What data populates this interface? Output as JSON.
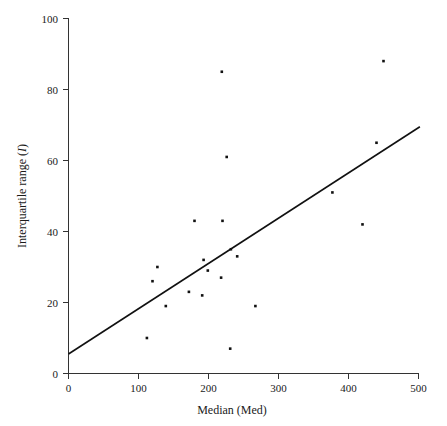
{
  "chart_data": {
    "type": "scatter",
    "title": "",
    "xlabel": "Median (Med)",
    "ylabel": "Interquartile range (I)",
    "ylabel_plain": "Interquartile range",
    "ylabel_symbol": "I",
    "xlim": [
      0,
      500
    ],
    "ylim": [
      0,
      100
    ],
    "xticks": [
      0,
      100,
      200,
      300,
      400,
      500
    ],
    "yticks": [
      0,
      20,
      40,
      60,
      80,
      100
    ],
    "xtick_labels": [
      "0",
      "100",
      "200",
      "300",
      "400",
      "500"
    ],
    "ytick_labels": [
      "0",
      "20",
      "40",
      "60",
      "80",
      "100"
    ],
    "grid": false,
    "legend": "none",
    "point_color": "#111111",
    "line_color": "#111111",
    "axis_color": "#333333",
    "background": "#ffffff",
    "marker": "square",
    "marker_size_px": 2.6,
    "series": [
      {
        "name": "observations",
        "points": [
          {
            "x": 112,
            "y": 10
          },
          {
            "x": 127,
            "y": 30
          },
          {
            "x": 120,
            "y": 26
          },
          {
            "x": 139,
            "y": 19
          },
          {
            "x": 180,
            "y": 43
          },
          {
            "x": 220,
            "y": 43
          },
          {
            "x": 172,
            "y": 23
          },
          {
            "x": 193,
            "y": 32
          },
          {
            "x": 199,
            "y": 29
          },
          {
            "x": 191,
            "y": 22
          },
          {
            "x": 218,
            "y": 27
          },
          {
            "x": 232,
            "y": 35
          },
          {
            "x": 241,
            "y": 33
          },
          {
            "x": 219,
            "y": 85
          },
          {
            "x": 226,
            "y": 61
          },
          {
            "x": 267,
            "y": 19
          },
          {
            "x": 231,
            "y": 7
          },
          {
            "x": 377,
            "y": 51
          },
          {
            "x": 420,
            "y": 42
          },
          {
            "x": 440,
            "y": 65
          },
          {
            "x": 450,
            "y": 88
          }
        ]
      }
    ],
    "fit_line": {
      "name": "regression-line",
      "x_start": 0,
      "y_start": 5.5,
      "x_end": 502,
      "y_end": 69.5
    }
  },
  "axes": {
    "x_axis_name": "x-axis",
    "y_axis_name": "y-axis"
  }
}
